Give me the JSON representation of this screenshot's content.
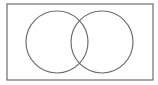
{
  "diagram": {
    "type": "venn",
    "universe": {
      "x": 7,
      "y": 4,
      "width": 146,
      "height": 76,
      "stroke": "#6e6e6e"
    },
    "sets": [
      {
        "id": "A",
        "cx": 57,
        "cy": 42,
        "r": 31,
        "stroke": "#6e6e6e"
      },
      {
        "id": "B",
        "cx": 102,
        "cy": 42,
        "r": 31,
        "stroke": "#6e6e6e"
      }
    ],
    "background": "#ffffff"
  }
}
